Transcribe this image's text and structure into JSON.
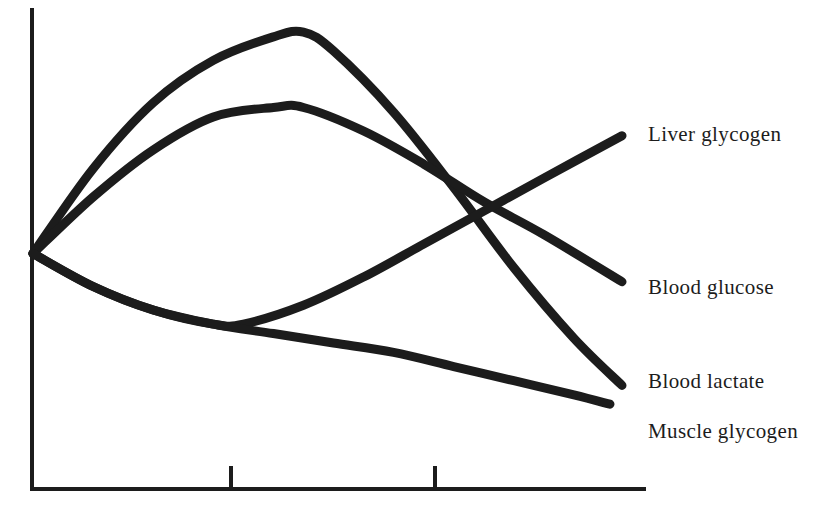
{
  "chart_data": {
    "type": "line",
    "title": "",
    "subtitle": "",
    "xlabel": "",
    "ylabel": "",
    "grid": false,
    "legend_position": "right-inline-end-of-line",
    "axis_style": "two-sided-open-L",
    "x_tick_labels": [
      "",
      ""
    ],
    "x_tick_count": 2,
    "y_tick_labels": [],
    "xlim": [
      0,
      100
    ],
    "ylim": [
      0,
      100
    ],
    "common_origin": {
      "x": 0,
      "y": 50
    },
    "series": [
      {
        "name": "Liver glycogen",
        "label": "Liver glycogen",
        "color": "#1c1c1c",
        "points": [
          {
            "x": 0,
            "y": 50
          },
          {
            "x": 10,
            "y": 68
          },
          {
            "x": 20,
            "y": 82
          },
          {
            "x": 30,
            "y": 91
          },
          {
            "x": 40,
            "y": 96
          },
          {
            "x": 45,
            "y": 97
          },
          {
            "x": 50,
            "y": 93
          },
          {
            "x": 60,
            "y": 80
          },
          {
            "x": 70,
            "y": 64
          },
          {
            "x": 80,
            "y": 47
          },
          {
            "x": 90,
            "y": 32
          },
          {
            "x": 98,
            "y": 22
          }
        ],
        "shape": "rise-to-peak-then-steep-decline",
        "peak": {
          "x": 45,
          "y": 97
        },
        "end": {
          "x": 98,
          "y": 22
        }
      },
      {
        "name": "Blood glucose",
        "label": "Blood glucose",
        "color": "#1c1c1c",
        "points": [
          {
            "x": 0,
            "y": 50
          },
          {
            "x": 10,
            "y": 62
          },
          {
            "x": 20,
            "y": 72
          },
          {
            "x": 30,
            "y": 79
          },
          {
            "x": 40,
            "y": 81
          },
          {
            "x": 45,
            "y": 81
          },
          {
            "x": 55,
            "y": 76
          },
          {
            "x": 65,
            "y": 69
          },
          {
            "x": 75,
            "y": 61
          },
          {
            "x": 85,
            "y": 54
          },
          {
            "x": 98,
            "y": 44
          }
        ],
        "shape": "rise-to-broad-plateau-then-gentle-decline",
        "peak": {
          "x": 43,
          "y": 81
        },
        "end": {
          "x": 98,
          "y": 44
        }
      },
      {
        "name": "Blood lactate",
        "label": "Blood lactate",
        "color": "#1c1c1c",
        "points": [
          {
            "x": 0,
            "y": 50
          },
          {
            "x": 10,
            "y": 43
          },
          {
            "x": 20,
            "y": 38
          },
          {
            "x": 30,
            "y": 35
          },
          {
            "x": 35,
            "y": 35
          },
          {
            "x": 45,
            "y": 39
          },
          {
            "x": 55,
            "y": 45
          },
          {
            "x": 65,
            "y": 52
          },
          {
            "x": 75,
            "y": 59
          },
          {
            "x": 85,
            "y": 66
          },
          {
            "x": 98,
            "y": 75
          }
        ],
        "shape": "shallow-dip-then-steady-rise",
        "minimum": {
          "x": 33,
          "y": 35
        },
        "end": {
          "x": 98,
          "y": 75
        }
      },
      {
        "name": "Muscle glycogen",
        "label": "Muscle glycogen",
        "color": "#1c1c1c",
        "points": [
          {
            "x": 0,
            "y": 50
          },
          {
            "x": 10,
            "y": 43
          },
          {
            "x": 20,
            "y": 38
          },
          {
            "x": 30,
            "y": 35
          },
          {
            "x": 40,
            "y": 33
          },
          {
            "x": 50,
            "y": 31
          },
          {
            "x": 60,
            "y": 29
          },
          {
            "x": 70,
            "y": 26
          },
          {
            "x": 80,
            "y": 23
          },
          {
            "x": 90,
            "y": 20
          },
          {
            "x": 96,
            "y": 18
          }
        ],
        "shape": "monotonic-gentle-decline",
        "end": {
          "x": 96,
          "y": 18
        }
      }
    ]
  },
  "labels": {
    "liver_glycogen": "Liver glycogen",
    "blood_glucose": "Blood glucose",
    "blood_lactate": "Blood lactate",
    "muscle_glycogen": "Muscle glycogen"
  },
  "colors": {
    "ink": "#1c1c1c",
    "background": "#ffffff"
  }
}
